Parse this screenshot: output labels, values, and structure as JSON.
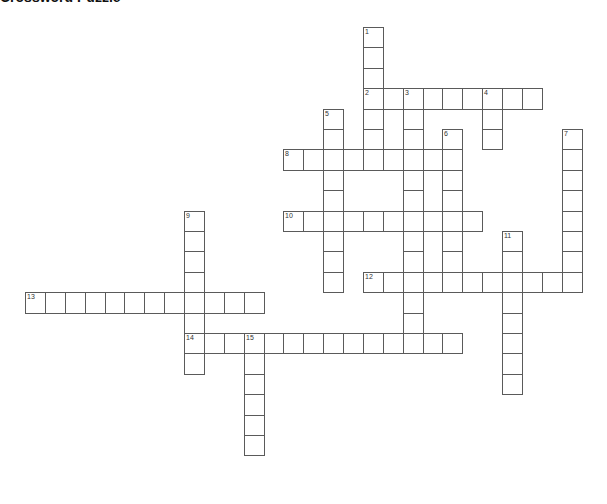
{
  "title": "Crossword Puzzle",
  "grid": {
    "origin_x": 25,
    "origin_y": 27,
    "col_pitch": 19.88,
    "row_pitch": 20.4
  },
  "clues": [
    {
      "number": "1",
      "direction": "down",
      "col": 17,
      "row": 0,
      "length": 7
    },
    {
      "number": "2",
      "direction": "across",
      "col": 17,
      "row": 3,
      "length": 9
    },
    {
      "number": "3",
      "direction": "down",
      "col": 19,
      "row": 3,
      "length": 13
    },
    {
      "number": "4",
      "direction": "down",
      "col": 23,
      "row": 3,
      "length": 3
    },
    {
      "number": "5",
      "direction": "down",
      "col": 15,
      "row": 4,
      "length": 9
    },
    {
      "number": "6",
      "direction": "down",
      "col": 21,
      "row": 5,
      "length": 8
    },
    {
      "number": "7",
      "direction": "down",
      "col": 27,
      "row": 5,
      "length": 8
    },
    {
      "number": "8",
      "direction": "across",
      "col": 13,
      "row": 6,
      "length": 9
    },
    {
      "number": "9",
      "direction": "down",
      "col": 8,
      "row": 9,
      "length": 8
    },
    {
      "number": "10",
      "direction": "across",
      "col": 13,
      "row": 9,
      "length": 10
    },
    {
      "number": "11",
      "direction": "down",
      "col": 24,
      "row": 10,
      "length": 8
    },
    {
      "number": "12",
      "direction": "across",
      "col": 17,
      "row": 12,
      "length": 11
    },
    {
      "number": "13",
      "direction": "across",
      "col": 0,
      "row": 13,
      "length": 12
    },
    {
      "number": "14",
      "direction": "across",
      "col": 8,
      "row": 15,
      "length": 14
    },
    {
      "number": "15",
      "direction": "down",
      "col": 11,
      "row": 15,
      "length": 6
    }
  ]
}
